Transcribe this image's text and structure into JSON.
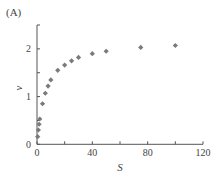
{
  "panel_label": "(A)",
  "chart_data": {
    "type": "scatter",
    "title": "",
    "panel_label": "(A)",
    "xlabel": "S",
    "ylabel": "v",
    "xlim": [
      0,
      120
    ],
    "ylim": [
      0,
      2.5
    ],
    "x_ticks": [
      0,
      20,
      40,
      60,
      80,
      100,
      120
    ],
    "x_tick_labels": [
      "0",
      "",
      "40",
      "",
      "80",
      "",
      "120"
    ],
    "y_ticks": [
      0,
      0.5,
      1,
      1.5,
      2,
      2.5
    ],
    "y_tick_labels": [
      "0",
      "",
      "1",
      "",
      "2",
      ""
    ],
    "grid": false,
    "legend": null,
    "marker": "diamond",
    "marker_color": "#7a7a7a",
    "series": [
      {
        "name": "v vs S",
        "x": [
          0.5,
          1,
          1.5,
          2,
          4,
          6,
          8,
          10,
          15,
          20,
          25,
          30,
          40,
          50,
          75,
          100
        ],
        "y": [
          0.16,
          0.3,
          0.42,
          0.53,
          0.85,
          1.07,
          1.22,
          1.35,
          1.55,
          1.66,
          1.75,
          1.82,
          1.9,
          1.95,
          2.03,
          2.07
        ]
      }
    ]
  }
}
